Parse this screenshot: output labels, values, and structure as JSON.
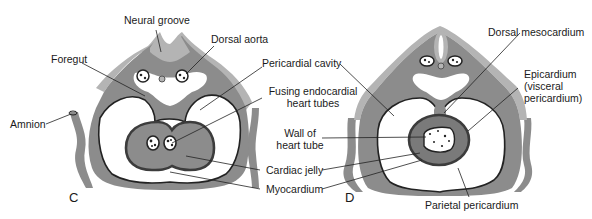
{
  "figure": {
    "colors": {
      "ectoderm_light": "#b4b4b4",
      "mesoderm_mid": "#8c8c8c",
      "myocardium_dark": "#3c3c3c",
      "heart_fill": "#7a7a7a",
      "cavity_white": "#ffffff",
      "line": "#222222"
    },
    "panels": [
      {
        "id": "C",
        "letter": "C",
        "labels": {
          "neural_groove": "Neural groove",
          "dorsal_aorta": "Dorsal aorta",
          "foregut": "Foregut",
          "amnion": "Amnion",
          "pericardial_cavity": "Pericardial cavity",
          "fusing_tubes_line1": "Fusing endocardial",
          "fusing_tubes_line2": "heart tubes",
          "cardiac_jelly": "Cardiac jelly",
          "myocardium": "Myocardium"
        }
      },
      {
        "id": "D",
        "letter": "D",
        "labels": {
          "dorsal_mesocardium": "Dorsal mesocardium",
          "epicardium_line1": "Epicardium",
          "epicardium_line2": "(visceral",
          "epicardium_line3": "pericardium)",
          "wall_line1": "Wall of",
          "wall_line2": "heart tube",
          "parietal_pericardium": "Parietal pericardium"
        }
      }
    ]
  }
}
